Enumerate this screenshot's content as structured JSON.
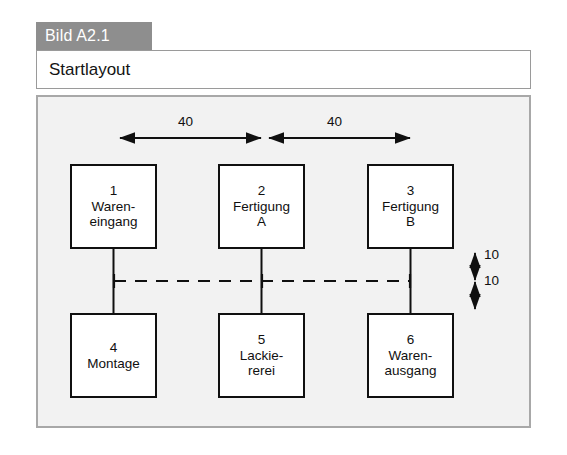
{
  "figure": {
    "tab_label": "Bild A2.1",
    "title": "Startlayout"
  },
  "diagram": {
    "type": "facility-layout",
    "boxes": [
      {
        "id": "1",
        "lines": [
          "Waren-",
          "eingang"
        ],
        "row": "top",
        "col": 1
      },
      {
        "id": "2",
        "lines": [
          "Fertigung",
          "A"
        ],
        "row": "top",
        "col": 2
      },
      {
        "id": "3",
        "lines": [
          "Fertigung",
          "B"
        ],
        "row": "top",
        "col": 3
      },
      {
        "id": "4",
        "lines": [
          "Montage"
        ],
        "row": "bottom",
        "col": 1
      },
      {
        "id": "5",
        "lines": [
          "Lackie-",
          "rerei"
        ],
        "row": "bottom",
        "col": 2
      },
      {
        "id": "6",
        "lines": [
          "Waren-",
          "ausgang"
        ],
        "row": "bottom",
        "col": 3
      }
    ],
    "dimensions": {
      "top_left": "40",
      "top_right": "40",
      "right_upper": "10",
      "right_lower": "10"
    },
    "colors": {
      "panel_background": "#f2f2f2",
      "panel_border": "#a8a8a8",
      "box_border": "#101010",
      "box_fill": "#ffffff",
      "tab_background": "#8e8e8e",
      "tab_text": "#ffffff",
      "line": "#101010"
    }
  }
}
